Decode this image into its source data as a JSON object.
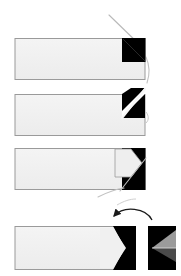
{
  "figure": {
    "name": "fold-sequence-diagram",
    "type": "instructional-step-diagram",
    "canvas": {
      "width": 181,
      "height": 276
    },
    "background_color": "#ffffff",
    "colors": {
      "panel_fill": "#eeeeee",
      "panel_fill_light": "#f2f2f2",
      "panel_border": "#9a9a9a",
      "black": "#000000",
      "dark_gray": "#1a1a1a",
      "mid_gray": "#808080",
      "light_gray": "#bdbdbd",
      "leader_line": "#b5b5b5",
      "arrow_stroke": "#1a1a1a"
    }
  },
  "steps": [
    {
      "id": "step-1",
      "label": "Step 1",
      "description": "Strip with solid black square tab at right end",
      "strip": {
        "x": 15,
        "y": 38,
        "width": 130,
        "height": 42
      },
      "tab": {
        "x": 122,
        "y": 38,
        "width": 23,
        "height": 24,
        "fill": "#000000"
      },
      "leader": {
        "x1": 110,
        "y1": 16,
        "x2": 144,
        "y2": 47
      },
      "leader2": {
        "x1": 146,
        "y1": 58,
        "x2": 149,
        "y2": 82
      }
    },
    {
      "id": "step-2",
      "label": "Step 2",
      "description": "Corner folded along diagonal, white crease from lower-left to upper-right",
      "strip": {
        "x": 15,
        "y": 94,
        "width": 130,
        "height": 42
      },
      "tab": {
        "x": 122,
        "y": 88,
        "width": 23,
        "height": 30,
        "fill": "#000000"
      },
      "crease": {
        "x1": 122,
        "y1": 118,
        "x2": 145,
        "y2": 90,
        "stroke": "#ffffff"
      }
    },
    {
      "id": "step-3",
      "label": "Step 3",
      "description": "Chevron notch cut into the black tab, arrow point formed",
      "strip": {
        "x": 15,
        "y": 148,
        "width": 130,
        "height": 42
      },
      "tab": {
        "x": 122,
        "y": 148,
        "width": 23,
        "height": 42,
        "fill": "#000000"
      },
      "leader": {
        "x1": 145,
        "y1": 160,
        "x2": 122,
        "y2": 190
      },
      "leader2": {
        "x1": 98,
        "y1": 196,
        "x2": 124,
        "y2": 188
      }
    },
    {
      "id": "step-4",
      "label": "Step 4",
      "description": "Completed arrow strip with rotated side view panel",
      "strip": {
        "x": 15,
        "y": 226,
        "width": 120,
        "height": 44
      },
      "tab": {
        "x": 113,
        "y": 226,
        "width": 22,
        "height": 44,
        "fill": "#000000"
      },
      "side_panel": {
        "x": 148,
        "y": 226,
        "width": 28,
        "height": 44,
        "fill": "#000000"
      },
      "rotation_arrow": {
        "name": "rotate-counterclockwise-arrow",
        "from_x": 152,
        "from_y": 222,
        "to_x": 115,
        "to_y": 220,
        "direction": "counterclockwise"
      }
    }
  ],
  "annotations": {
    "leader_lines": 4,
    "rotation_arrows": 1,
    "visible_text": []
  }
}
